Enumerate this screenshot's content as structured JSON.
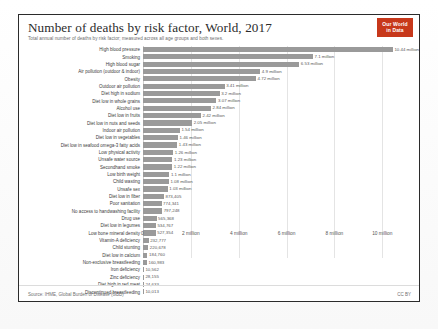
{
  "header": {
    "title": "Number of deaths by risk factor, World, 2017",
    "subtitle": "Total annual number of deaths by risk factor; measured across all age groups and both sexes.",
    "logo_line1": "Our World",
    "logo_line2": "in Data"
  },
  "footer": {
    "source": "Source: IHME, Global Burden of Disease (GBD)",
    "license": "CC BY"
  },
  "colors": {
    "bar": "#9a9a9a",
    "badge": "#c7381b",
    "border": "#2b2b2b",
    "grid": "#e4e4e4"
  },
  "chart_data": {
    "type": "bar",
    "orientation": "horizontal",
    "title": "Number of deaths by risk factor, World, 2017",
    "subtitle": "Total annual number of deaths by risk factor; measured across all age groups and both sexes.",
    "xlabel": "",
    "ylabel": "",
    "xlim": [
      0,
      11200000
    ],
    "grid": true,
    "legend": false,
    "tick_labels": [
      "0",
      "2 million",
      "4 million",
      "6 million",
      "8 million",
      "10 million"
    ],
    "tick_values": [
      0,
      2000000,
      4000000,
      6000000,
      8000000,
      10000000
    ],
    "categories": [
      "High blood pressure",
      "Smoking",
      "High blood sugar",
      "Air pollution (outdoor & indoor)",
      "Obesity",
      "Outdoor air pollution",
      "Diet high in sodium",
      "Diet low in whole grains",
      "Alcohol use",
      "Diet low in fruits",
      "Diet low in nuts and seeds",
      "Indoor air pollution",
      "Diet low in vegetables",
      "Diet low in seafood omega-3 fatty acids",
      "Low physical activity",
      "Unsafe water source",
      "Secondhand smoke",
      "Low birth weight",
      "Child wasting",
      "Unsafe sex",
      "Diet low in fiber",
      "Poor sanitation",
      "No access to handwashing facility",
      "Drug use",
      "Diet low in legumes",
      "Low bone mineral density",
      "Vitamin-A deficiency",
      "Child stunting",
      "Diet low in calcium",
      "Non-exclusive breastfeeding",
      "Iron deficiency",
      "Zinc deficiency",
      "Diet high in red meat",
      "Discontinued breastfeeding"
    ],
    "values": [
      10440000,
      7100000,
      6530000,
      4900000,
      4720000,
      3410000,
      3200000,
      3070000,
      2840000,
      2420000,
      2050000,
      1540000,
      1460000,
      1430000,
      1260000,
      1230000,
      1220000,
      1100000,
      1080000,
      1030000,
      873405,
      774341,
      797248,
      565368,
      534767,
      527354,
      232777,
      220678,
      184760,
      160983,
      10562,
      28155,
      24633,
      10013
    ],
    "value_labels": [
      "10.44 million",
      "7.1 million",
      "6.53 million",
      "4.9 million",
      "4.72 million",
      "3.41 million",
      "3.2 million",
      "3.07 million",
      "2.84 million",
      "2.42 million",
      "2.05 million",
      "1.54 million",
      "1.46 million",
      "1.43 million",
      "1.26 million",
      "1.23 million",
      "1.22 million",
      "1.1 million",
      "1.08 million",
      "1.03 million",
      "873,405",
      "774,341",
      "797,248",
      "565,368",
      "534,767",
      "527,354",
      "232,777",
      "220,678",
      "184,760",
      "160,983",
      "10,562",
      "28,155",
      "24,633",
      "10,013"
    ]
  }
}
